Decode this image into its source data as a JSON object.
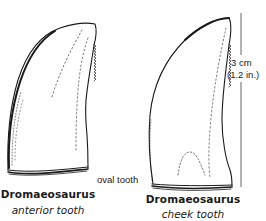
{
  "figure": {
    "teeth": [
      {
        "genus": "Dromaeosaurus",
        "type": "anterior tooth"
      },
      {
        "genus": "Dromaeosaurus",
        "type": "cheek tooth"
      }
    ],
    "annotation": "oval tooth",
    "scale": {
      "metric": "3 cm",
      "imperial": "(1.2 in.)"
    },
    "colors": {
      "ink": "#1a1a1a",
      "background": "#ffffff"
    }
  }
}
